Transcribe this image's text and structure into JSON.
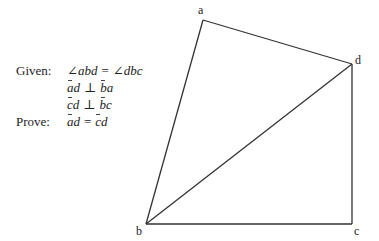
{
  "statements": {
    "given_label": "Given:",
    "prove_label": "Prove:",
    "given": [
      {
        "left": "∠abd",
        "op": "=",
        "right": "∠dbc",
        "segments": false
      },
      {
        "left": "ad",
        "op": "⊥",
        "right": "ba",
        "segments": true
      },
      {
        "left": "cd",
        "op": "⊥",
        "right": "bc",
        "segments": true
      }
    ],
    "prove": {
      "left": "ad",
      "op": "=",
      "right": "cd",
      "segments": true
    }
  },
  "figure": {
    "vertices": {
      "a": {
        "label": "a",
        "x": 203,
        "y": 20
      },
      "b": {
        "label": "b",
        "x": 146,
        "y": 224
      },
      "c": {
        "label": "c",
        "x": 352,
        "y": 224
      },
      "d": {
        "label": "d",
        "x": 352,
        "y": 64
      }
    },
    "segments": [
      "ab",
      "ad",
      "bd",
      "bc",
      "cd"
    ],
    "stroke_color": "#333333"
  }
}
